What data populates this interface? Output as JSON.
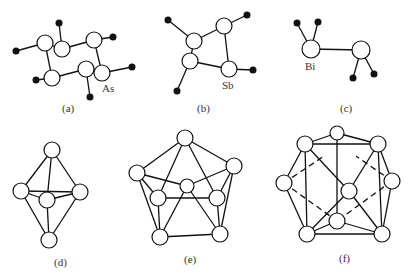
{
  "figure": {
    "panels": [
      {
        "id": "a",
        "caption": "(a)",
        "element_label": "As"
      },
      {
        "id": "b",
        "caption": "(b)",
        "element_label": "Sb"
      },
      {
        "id": "c",
        "caption": "(c)",
        "element_label": "Bi"
      },
      {
        "id": "d",
        "caption": "(d)"
      },
      {
        "id": "e",
        "caption": "(e)"
      },
      {
        "id": "f",
        "caption": "(f)"
      }
    ]
  }
}
